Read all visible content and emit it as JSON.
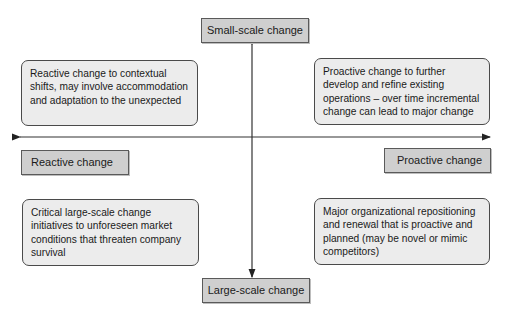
{
  "diagram": {
    "axis_labels": {
      "top": "Small-scale change",
      "bottom": "Large-scale change",
      "left": "Reactive change",
      "right": "Proactive change"
    },
    "quadrants": {
      "top_left": "Reactive change to contextual shifts, may involve accommodation and adaptation to the unexpected",
      "top_right": "Proactive change to further develop and refine existing operations – over time incremental change can lead to major change",
      "bottom_left": "Critical large-scale change initiatives to unforeseen market conditions that threaten company survival",
      "bottom_right": "Major organizational repositioning and renewal that is proactive and planned (may be novel or mimic competitors)"
    },
    "colors": {
      "label_fill": "#cfcfcf",
      "quadrant_fill": "#ececec",
      "line": "#333333"
    }
  }
}
